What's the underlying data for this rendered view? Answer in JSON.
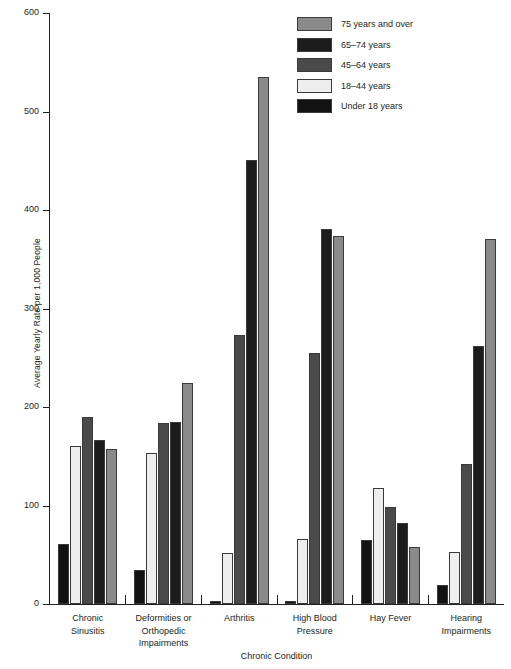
{
  "chart_data": {
    "type": "bar",
    "title": "",
    "xlabel": "Chronic Condition",
    "ylabel": "Average Yearly Rate per 1,000 People",
    "ylim": [
      0,
      600
    ],
    "yticks": [
      0,
      100,
      200,
      300,
      400,
      500,
      600
    ],
    "grid": false,
    "legend_position": "top-right",
    "categories": [
      "Chronic Sinusitis",
      "Deformities or Orthopedic Impairments",
      "Arthritis",
      "High Blood Pressure",
      "Hay Fever",
      "Hearing Impairments"
    ],
    "category_lines": [
      [
        "Chronic",
        "Sinusitis"
      ],
      [
        "Deformities or",
        "Orthopedic",
        "Impairments"
      ],
      [
        "Arthritis"
      ],
      [
        "High Blood",
        "Pressure"
      ],
      [
        "Hay Fever"
      ],
      [
        "Hearing",
        "Impairments"
      ]
    ],
    "series": [
      {
        "name": "Under 18 years",
        "color": "#121212",
        "values": [
          61,
          35,
          3,
          3,
          65,
          19
        ]
      },
      {
        "name": "18–44 years",
        "color": "#eeeeee",
        "values": [
          160,
          153,
          52,
          66,
          118,
          53
        ]
      },
      {
        "name": "45–64 years",
        "color": "#4a4a4a",
        "values": [
          190,
          184,
          273,
          255,
          98,
          142
        ]
      },
      {
        "name": "65–74 years",
        "color": "#1c1c1c",
        "values": [
          167,
          185,
          451,
          381,
          82,
          262
        ]
      },
      {
        "name": "75 years and over",
        "color": "#8a8a8a",
        "values": [
          157,
          224,
          535,
          374,
          58,
          371
        ]
      }
    ],
    "legend_order": [
      "75 years and over",
      "65–74 years",
      "45–64 years",
      "18–44 years",
      "Under 18 years"
    ],
    "bar_order_in_group": [
      "Under 18 years",
      "18–44 years",
      "45–64 years",
      "65–74 years",
      "75 years and over"
    ]
  }
}
